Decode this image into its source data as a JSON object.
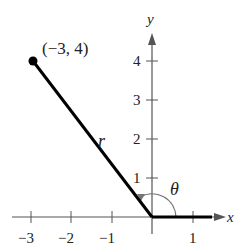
{
  "diagram": {
    "point": {
      "label": "(−3, 4)",
      "x": -3,
      "y": 4
    },
    "segment_label": "r",
    "angle_label": "θ",
    "axes": {
      "x_label": "x",
      "y_label": "y"
    },
    "x_ticks": [
      "−3",
      "−2",
      "−1",
      "1"
    ],
    "y_ticks": [
      "1",
      "2",
      "3",
      "4"
    ],
    "colors": {
      "line": "#000000",
      "axis": "#555555",
      "arc": "#777777"
    }
  }
}
